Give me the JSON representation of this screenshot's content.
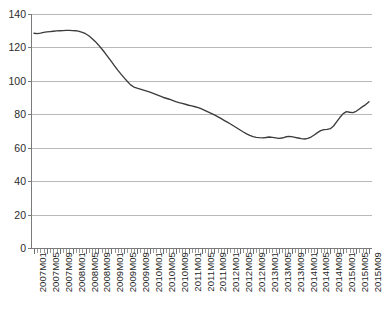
{
  "chart_data": {
    "type": "line",
    "title": "",
    "subtitle": "",
    "xlabel": "",
    "ylabel": "",
    "ylim": [
      0,
      140
    ],
    "ytick_values": [
      0,
      20,
      40,
      60,
      80,
      100,
      120,
      140
    ],
    "ytick_labels": [
      "0",
      "20",
      "40",
      "60",
      "80",
      "100",
      "120",
      "140"
    ],
    "grid": true,
    "legend": null,
    "legend_position": "none",
    "line_color": "#3c3c3c",
    "grid_color": "#b9b9b9",
    "axis_color": "#7a7a7a",
    "x_tick_label_rotation": -90,
    "x_tick_label_interval_months": 4,
    "xtick_labels": [
      "2007M01",
      "2007M05",
      "2007M09",
      "2008M01",
      "2008M05",
      "2008M09",
      "2009M01",
      "2009M05",
      "2009M09",
      "2010M01",
      "2010M05",
      "2010M09",
      "2011M01",
      "2011M05",
      "2011M09",
      "2012M01",
      "2012M05",
      "2012M09",
      "2013M01",
      "2013M05",
      "2013M09",
      "2014M01",
      "2014M05",
      "2014M09",
      "2015M01",
      "2015M05",
      "2015M09"
    ],
    "x": [
      "2007M01",
      "2007M02",
      "2007M03",
      "2007M04",
      "2007M05",
      "2007M06",
      "2007M07",
      "2007M08",
      "2007M09",
      "2007M10",
      "2007M11",
      "2007M12",
      "2008M01",
      "2008M02",
      "2008M03",
      "2008M04",
      "2008M05",
      "2008M06",
      "2008M07",
      "2008M08",
      "2008M09",
      "2008M10",
      "2008M11",
      "2008M12",
      "2009M01",
      "2009M02",
      "2009M03",
      "2009M04",
      "2009M05",
      "2009M06",
      "2009M07",
      "2009M08",
      "2009M09",
      "2009M10",
      "2009M11",
      "2009M12",
      "2010M01",
      "2010M02",
      "2010M03",
      "2010M04",
      "2010M05",
      "2010M06",
      "2010M07",
      "2010M08",
      "2010M09",
      "2010M10",
      "2010M11",
      "2010M12",
      "2011M01",
      "2011M02",
      "2011M03",
      "2011M04",
      "2011M05",
      "2011M06",
      "2011M07",
      "2011M08",
      "2011M09",
      "2011M10",
      "2011M11",
      "2011M12",
      "2012M01",
      "2012M02",
      "2012M03",
      "2012M04",
      "2012M05",
      "2012M06",
      "2012M07",
      "2012M08",
      "2012M09",
      "2012M10",
      "2012M11",
      "2012M12",
      "2013M01",
      "2013M02",
      "2013M03",
      "2013M04",
      "2013M05",
      "2013M06",
      "2013M07",
      "2013M08",
      "2013M09",
      "2013M10",
      "2013M11",
      "2013M12",
      "2014M01",
      "2014M02",
      "2014M03",
      "2014M04",
      "2014M05",
      "2014M06",
      "2014M07",
      "2014M08",
      "2014M09",
      "2014M10",
      "2014M11",
      "2014M12",
      "2015M01",
      "2015M02",
      "2015M03",
      "2015M04",
      "2015M05",
      "2015M06",
      "2015M07",
      "2015M08",
      "2015M09"
    ],
    "values": [
      128.5,
      128.3,
      128.6,
      129.0,
      129.3,
      129.5,
      129.7,
      129.9,
      130.0,
      130.1,
      130.2,
      130.2,
      130.1,
      130.0,
      129.6,
      129.0,
      128.2,
      127.0,
      125.4,
      123.6,
      121.5,
      119.2,
      116.8,
      114.2,
      111.6,
      109.0,
      106.4,
      104.0,
      101.8,
      99.6,
      97.6,
      96.3,
      95.6,
      95.0,
      94.4,
      93.8,
      93.2,
      92.5,
      91.8,
      91.0,
      90.2,
      89.6,
      89.0,
      88.3,
      87.6,
      87.0,
      86.5,
      86.0,
      85.4,
      85.0,
      84.5,
      84.0,
      83.2,
      82.4,
      81.5,
      80.6,
      79.6,
      78.6,
      77.5,
      76.4,
      75.3,
      74.2,
      73.0,
      71.8,
      70.6,
      69.4,
      68.3,
      67.4,
      66.6,
      66.2,
      66.0,
      65.9,
      66.1,
      66.4,
      66.2,
      65.9,
      65.6,
      65.8,
      66.4,
      66.8,
      66.6,
      66.2,
      65.8,
      65.4,
      65.2,
      65.6,
      66.4,
      67.6,
      69.0,
      70.2,
      70.8,
      71.0,
      71.4,
      73.0,
      75.6,
      78.2,
      80.4,
      81.6,
      81.2,
      81.0,
      81.8,
      83.2,
      84.6,
      85.8,
      87.5
    ]
  }
}
